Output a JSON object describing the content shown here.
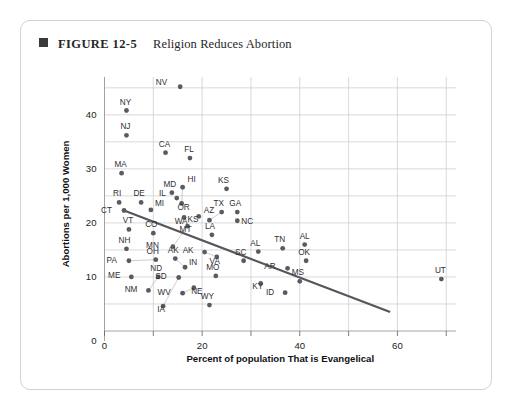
{
  "figure": {
    "bullet_icon": "filled-square-icon",
    "label": "FIGURE 12-5",
    "title": "Religion Reduces Abortion"
  },
  "chart_data": {
    "type": "scatter",
    "title": "Religion Reduces Abortion",
    "xlabel": "Percent of population That is Evangelical",
    "ylabel": "Abortions per 1,000 Women",
    "xlim": [
      0,
      72
    ],
    "ylim": [
      0,
      47
    ],
    "xticks": [
      0,
      20,
      40,
      60
    ],
    "yticks": [
      10,
      20,
      30,
      40
    ],
    "x_minor_gridlines": [
      10,
      30,
      50,
      70
    ],
    "y_minor_gridlines": [
      5,
      15,
      25,
      35,
      45
    ],
    "grid": true,
    "legend": "none",
    "trendline": {
      "type": "linear",
      "x_start": 4.0,
      "y_start": 22.3,
      "x_end": 58.5,
      "y_end": 3.5
    },
    "points": [
      {
        "label": "NV",
        "x": 15.5,
        "y": 45.2,
        "label_dx": -13,
        "label_dy": -2
      },
      {
        "label": "NY",
        "x": 4.5,
        "y": 40.8,
        "label_dx": -1,
        "label_dy": -6
      },
      {
        "label": "NJ",
        "x": 4.5,
        "y": 36.2,
        "label_dx": -1,
        "label_dy": -6
      },
      {
        "label": "CA",
        "x": 12.5,
        "y": 33.0,
        "label_dx": -1,
        "label_dy": -6
      },
      {
        "label": "FL",
        "x": 17.5,
        "y": 32.0,
        "label_dx": -1,
        "label_dy": -6
      },
      {
        "label": "MA",
        "x": 3.5,
        "y": 29.2,
        "label_dx": -1,
        "label_dy": -6
      },
      {
        "label": "HI",
        "x": 16.0,
        "y": 26.6,
        "label_dx": 5,
        "label_dy": -5
      },
      {
        "label": "MD",
        "x": 13.8,
        "y": 25.6,
        "label_dx": -2,
        "label_dy": -6
      },
      {
        "label": "IL",
        "x": 14.8,
        "y": 24.6,
        "label_dx": -11,
        "label_dy": -2
      },
      {
        "label": "OR",
        "x": 15.8,
        "y": 23.6,
        "label_dx": 2,
        "label_dy": 7
      },
      {
        "label": "RI",
        "x": 3.0,
        "y": 23.8,
        "label_dx": -2,
        "label_dy": -6
      },
      {
        "label": "DE",
        "x": 7.5,
        "y": 23.8,
        "label_dx": -2,
        "label_dy": -6
      },
      {
        "label": "MI",
        "x": 9.5,
        "y": 22.4,
        "label_dx": 4,
        "label_dy": -4
      },
      {
        "label": "CT",
        "x": 4.0,
        "y": 22.3,
        "label_dx": -12,
        "label_dy": 3
      },
      {
        "label": "WA",
        "x": 16.3,
        "y": 21.0,
        "label_dx": -3,
        "label_dy": 6
      },
      {
        "label": "AZ",
        "x": 19.3,
        "y": 21.2,
        "label_dx": 5,
        "label_dy": -3
      },
      {
        "label": "KS",
        "x": 25.0,
        "y": 26.3,
        "label_dx": -3,
        "label_dy": -6
      },
      {
        "label": "TX",
        "x": 24.0,
        "y": 22.0,
        "label_dx": -3,
        "label_dy": -6
      },
      {
        "label": "GA",
        "x": 27.2,
        "y": 22.0,
        "label_dx": -2,
        "label_dy": -6
      },
      {
        "label": "NC",
        "x": 27.2,
        "y": 20.4,
        "label_dx": 4,
        "label_dy": 3
      },
      {
        "label": "KS",
        "x": 21.5,
        "y": 20.5,
        "label_dx": -11,
        "label_dy": 2
      },
      {
        "label": "VT",
        "x": 5.0,
        "y": 18.8,
        "label_dx": -1,
        "label_dy": -6
      },
      {
        "label": "CO",
        "x": 10.0,
        "y": 18.1,
        "label_dx": -2,
        "label_dy": -6
      },
      {
        "label": "MT",
        "x": 17.0,
        "y": 19.4,
        "label_dx": -2,
        "label_dy": 6
      },
      {
        "label": "LA",
        "x": 22.0,
        "y": 17.8,
        "label_dx": -2,
        "label_dy": -6
      },
      {
        "label": "NH",
        "x": 4.5,
        "y": 15.2,
        "label_dx": -2,
        "label_dy": -6
      },
      {
        "label": "MN",
        "x": 14.0,
        "y": 15.6,
        "label_dx": -14,
        "label_dy": 1
      },
      {
        "label": "AK",
        "x": 20.5,
        "y": 14.6,
        "label_dx": -11,
        "label_dy": 1
      },
      {
        "label": "VA",
        "x": 23.0,
        "y": 13.7,
        "label_dx": -2,
        "label_dy": 7
      },
      {
        "label": "SC",
        "x": 28.5,
        "y": 13.0,
        "label_dx": -3,
        "label_dy": -6
      },
      {
        "label": "AL",
        "x": 31.5,
        "y": 14.7,
        "label_dx": -3,
        "label_dy": -6
      },
      {
        "label": "TN",
        "x": 36.5,
        "y": 15.3,
        "label_dx": -3,
        "label_dy": -6
      },
      {
        "label": "AL",
        "x": 41.0,
        "y": 16.0,
        "label_dx": 0,
        "label_dy": -6
      },
      {
        "label": "OK",
        "x": 41.3,
        "y": 13.0,
        "label_dx": -2,
        "label_dy": -6
      },
      {
        "label": "PA",
        "x": 5.0,
        "y": 13.0,
        "label_dx": -12,
        "label_dy": 2
      },
      {
        "label": "OH",
        "x": 10.5,
        "y": 13.2,
        "label_dx": -3,
        "label_dy": -6
      },
      {
        "label": "AK",
        "x": 14.5,
        "y": 13.4,
        "label_dx": -2,
        "label_dy": -6
      },
      {
        "label": "IN",
        "x": 16.5,
        "y": 11.8,
        "label_dx": 4,
        "label_dy": -2
      },
      {
        "label": "MO",
        "x": 22.8,
        "y": 10.2,
        "label_dx": -3,
        "label_dy": -6
      },
      {
        "label": "AR",
        "x": 37.5,
        "y": 11.6,
        "label_dx": -12,
        "label_dy": 1
      },
      {
        "label": "MS",
        "x": 40.0,
        "y": 9.2,
        "label_dx": -2,
        "label_dy": -6
      },
      {
        "label": "ME",
        "x": 5.5,
        "y": 10.0,
        "label_dx": -11,
        "label_dy": 1
      },
      {
        "label": "ND",
        "x": 11.0,
        "y": 10.0,
        "label_dx": -2,
        "label_dy": -6
      },
      {
        "label": "SD",
        "x": 15.2,
        "y": 9.9,
        "label_dx": -12,
        "label_dy": 2
      },
      {
        "label": "NM",
        "x": 9.0,
        "y": 7.5,
        "label_dx": -11,
        "label_dy": 2
      },
      {
        "label": "WV",
        "x": 16.0,
        "y": 7.0,
        "label_dx": -12,
        "label_dy": 2
      },
      {
        "label": "NE",
        "x": 18.3,
        "y": 8.0,
        "label_dx": 3,
        "label_dy": 6
      },
      {
        "label": "KY",
        "x": 32.0,
        "y": 8.8,
        "label_dx": -3,
        "label_dy": 6
      },
      {
        "label": "ID",
        "x": 37.0,
        "y": 7.1,
        "label_dx": -11,
        "label_dy": 2
      },
      {
        "label": "IA",
        "x": 12.0,
        "y": 4.6,
        "label_dx": -2,
        "label_dy": 6
      },
      {
        "label": "WY",
        "x": 21.5,
        "y": 4.8,
        "label_dx": -2,
        "label_dy": -6
      },
      {
        "label": "UT",
        "x": 69.0,
        "y": 9.6,
        "label_dx": -1,
        "label_dy": -6
      }
    ],
    "leaders": [
      {
        "x1": 9.0,
        "y1": 7.5,
        "x2": 11.0,
        "y2": 10.0
      },
      {
        "x1": 12.0,
        "y1": 4.6,
        "x2": 15.2,
        "y2": 9.9
      },
      {
        "x1": 16.0,
        "y1": 7.0,
        "x2": 18.3,
        "y2": 8.0
      },
      {
        "x1": 15.8,
        "y1": 23.6,
        "x2": 16.0,
        "y2": 26.6
      },
      {
        "x1": 14.0,
        "y1": 15.6,
        "x2": 17.0,
        "y2": 19.4
      },
      {
        "x1": 14.5,
        "y1": 13.4,
        "x2": 16.5,
        "y2": 11.8
      },
      {
        "x1": 5.0,
        "y1": 13.0,
        "x2": 10.5,
        "y2": 13.2
      },
      {
        "x1": 21.5,
        "y1": 20.5,
        "x2": 24.0,
        "y2": 22.0
      },
      {
        "x1": 20.5,
        "y1": 14.6,
        "x2": 23.0,
        "y2": 13.7
      }
    ]
  }
}
